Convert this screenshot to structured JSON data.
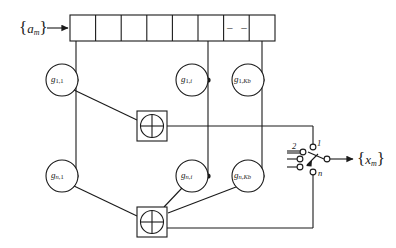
{
  "diagram": {
    "input": {
      "name": "input-sequence",
      "symbol": "a",
      "subscript": "m",
      "open_brace": "{",
      "close_brace": "}"
    },
    "output": {
      "name": "output-sequence",
      "symbol": "x",
      "subscript": "m",
      "open_brace": "{",
      "close_brace": "}"
    },
    "register": {
      "name": "shift-register",
      "cell_count": 8,
      "ellipsis_cell_index": 6,
      "ellipsis_text": "– –",
      "tapped_cells": [
        0,
        5,
        7
      ]
    },
    "gain_rows": [
      {
        "row_name": "gain-row-1",
        "gains": [
          {
            "symbol": "g",
            "sub1": "1,",
            "sub2": "1",
            "label": "g1,1"
          },
          {
            "symbol": "g",
            "sub1": "1,",
            "sub2": "i",
            "label": "g1,i"
          },
          {
            "symbol": "g",
            "sub1": "1,",
            "sub2": "Kb",
            "label": "g1,Kb"
          }
        ],
        "adder": {
          "name": "adder-1",
          "symbol": "+"
        }
      },
      {
        "row_name": "gain-row-n",
        "gains": [
          {
            "symbol": "g",
            "sub1": "n,",
            "sub2": "1",
            "label": "gn,1"
          },
          {
            "symbol": "g",
            "sub1": "n,",
            "sub2": "i",
            "label": "gn,i"
          },
          {
            "symbol": "g",
            "sub1": "n,",
            "sub2": "Kb",
            "label": "gn,Kb"
          }
        ],
        "adder": {
          "name": "adder-n",
          "symbol": "+"
        }
      }
    ],
    "switch": {
      "name": "rotary-selector-switch",
      "contacts": [
        {
          "id": "contact-1",
          "label": "1"
        },
        {
          "id": "contact-2",
          "label": "2"
        },
        {
          "id": "contact-3",
          "label": ""
        },
        {
          "id": "contact-4",
          "label": ""
        },
        {
          "id": "contact-n",
          "label": "n"
        }
      ]
    },
    "colors": {
      "stroke": "#1a1a1a",
      "fill": "#ffffff",
      "background": "#ffffff"
    }
  }
}
